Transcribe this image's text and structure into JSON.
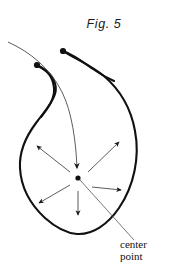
{
  "figure": {
    "title": "Fig. 5",
    "caption_label": {
      "line1": "center",
      "line2": "point",
      "full_text": "center point"
    },
    "colors": {
      "ink": "#1a1a1a",
      "outline": "#111111",
      "thin_line": "#4a4a4a",
      "background": "#ffffff"
    },
    "shape": {
      "name": "leaf-outline",
      "description": "closed teardrop / leaf-shaped outline with notched top-left lobe"
    },
    "center_point": {
      "name": "center-point-dot",
      "x": 78,
      "y": 178
    },
    "arrows": [
      {
        "name": "arrow-up-left",
        "direction": "up-left",
        "from_x": 70,
        "from_y": 172,
        "to_x": 36,
        "to_y": 145
      },
      {
        "name": "arrow-up-right",
        "direction": "up-right",
        "from_x": 88,
        "from_y": 172,
        "to_x": 120,
        "to_y": 141
      },
      {
        "name": "arrow-down-left",
        "direction": "down-left",
        "from_x": 70,
        "from_y": 185,
        "to_x": 38,
        "to_y": 204
      },
      {
        "name": "arrow-right",
        "direction": "right",
        "from_x": 92,
        "from_y": 187,
        "to_x": 122,
        "to_y": 190
      },
      {
        "name": "arrow-down",
        "direction": "down",
        "from_x": 78,
        "from_y": 190,
        "to_x": 78,
        "to_y": 216
      },
      {
        "name": "arrow-inflow-top",
        "direction": "down-into-center",
        "from_x": 8,
        "from_y": 42,
        "to_x": 78,
        "to_y": 172
      }
    ],
    "dots": [
      {
        "name": "tail-dot-left",
        "x": 37,
        "y": 65
      },
      {
        "name": "tail-dot-top",
        "x": 63,
        "y": 51
      }
    ],
    "leader_line": {
      "name": "label-leader-line",
      "from_x": 80,
      "from_y": 180,
      "to_x": 134,
      "to_y": 240
    }
  }
}
